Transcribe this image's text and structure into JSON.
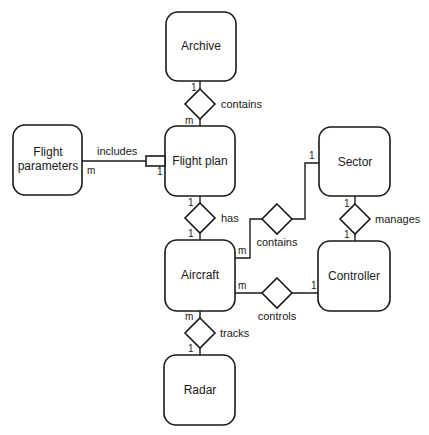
{
  "diagram": {
    "type": "entity-relationship",
    "entities": {
      "archive": "Archive",
      "flight_plan": "Flight plan",
      "flight_parameters_line1": "Flight",
      "flight_parameters_line2": "parameters",
      "sector": "Sector",
      "aircraft": "Aircraft",
      "controller": "Controller",
      "radar": "Radar"
    },
    "relationships": {
      "archive_flightplan": {
        "label": "contains",
        "card_a": "1",
        "card_b": "m"
      },
      "flightparams_flightplan": {
        "label": "includes",
        "card_a": "m",
        "card_b": "1"
      },
      "flightplan_aircraft": {
        "label": "has",
        "card_a": "1",
        "card_b": "1"
      },
      "aircraft_sector": {
        "label": "contains",
        "card_a": "m",
        "card_b": "1"
      },
      "sector_controller": {
        "label": "manages",
        "card_a": "1",
        "card_b": "1"
      },
      "aircraft_controller": {
        "label": "controls",
        "card_a": "m",
        "card_b": "1"
      },
      "aircraft_radar": {
        "label": "tracks",
        "card_a": "m",
        "card_b": "1"
      }
    },
    "colors": {
      "stroke": "#1a1a1a",
      "fill": "#ffffff",
      "background": "#ffffff"
    }
  }
}
